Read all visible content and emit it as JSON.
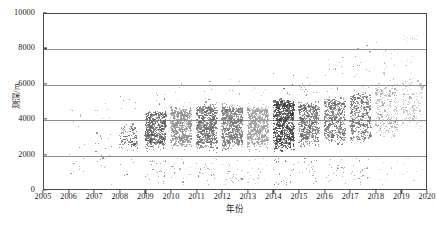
{
  "chart_data": {
    "type": "scatter",
    "title": "",
    "xlabel": "年份",
    "ylabel": "测深/m",
    "xlim": [
      2005,
      2020
    ],
    "ylim": [
      0,
      10000
    ],
    "xticks": [
      2005,
      2006,
      2007,
      2008,
      2009,
      2010,
      2011,
      2012,
      2013,
      2014,
      2015,
      2016,
      2017,
      2018,
      2019,
      2020
    ],
    "yticks": [
      0,
      2000,
      4000,
      6000,
      8000,
      10000
    ],
    "xtick_labels": [
      "2005",
      "2006",
      "2007",
      "2008",
      "2009",
      "2010",
      "2011",
      "2012",
      "2013",
      "2014",
      "2015",
      "2016",
      "2017",
      "2018",
      "2019",
      "2020"
    ],
    "ytick_labels": [
      "0",
      "2000",
      "4000",
      "6000",
      "8000",
      "10000"
    ],
    "grid": "horizontal",
    "gridline_values": [
      2000,
      4000,
      6000,
      8000
    ],
    "legend": "none",
    "marker": "filled-circle",
    "marker_size_px": 1.2,
    "point_color": "#6e6e6e",
    "frame_color": "#4a4a4a",
    "gridline_color": "#8f8f8f",
    "background": "#ffffff",
    "series": [
      {
        "name": "测深",
        "year_bands": [
          {
            "year": 2006,
            "count": 6,
            "core_low": 1100,
            "core_high": 2700,
            "shade": "#7a7a7a",
            "spread": "sparse"
          },
          {
            "year": 2007,
            "count": 16,
            "core_low": 1800,
            "core_high": 3100,
            "shade": "#767676",
            "spread": "sparse"
          },
          {
            "year": 2008,
            "count": 120,
            "core_low": 2550,
            "core_high": 3500,
            "shade": "#5f5f5f",
            "spread": "light"
          },
          {
            "year": 2009,
            "count": 520,
            "core_low": 2700,
            "core_high": 4200,
            "shade": "#5a5a5a",
            "spread": "dense"
          },
          {
            "year": 2010,
            "count": 640,
            "core_low": 2750,
            "core_high": 4350,
            "shade": "#8e8e8e",
            "spread": "dense"
          },
          {
            "year": 2011,
            "count": 700,
            "core_low": 2700,
            "core_high": 4500,
            "shade": "#6b6b6b",
            "spread": "dense"
          },
          {
            "year": 2012,
            "count": 700,
            "core_low": 2700,
            "core_high": 4500,
            "shade": "#757575",
            "spread": "dense"
          },
          {
            "year": 2013,
            "count": 660,
            "core_low": 2750,
            "core_high": 4450,
            "shade": "#9a9a9a",
            "spread": "dense"
          },
          {
            "year": 2014,
            "count": 820,
            "core_low": 2700,
            "core_high": 4800,
            "shade": "#3d3d3d",
            "spread": "dense"
          },
          {
            "year": 2015,
            "count": 560,
            "core_low": 2900,
            "core_high": 4700,
            "shade": "#6a6a6a",
            "spread": "dense"
          },
          {
            "year": 2016,
            "count": 520,
            "core_low": 3000,
            "core_high": 4900,
            "shade": "#707070",
            "spread": "dense"
          },
          {
            "year": 2017,
            "count": 470,
            "core_low": 3100,
            "core_high": 5200,
            "shade": "#6d6d6d",
            "spread": "dense"
          },
          {
            "year": 2018,
            "count": 240,
            "core_low": 3400,
            "core_high": 5500,
            "shade": "#a6a6a6",
            "spread": "medium"
          },
          {
            "year": 2019,
            "count": 150,
            "core_low": 3700,
            "core_high": 5900,
            "shade": "#b4b4b4",
            "spread": "medium"
          },
          {
            "year": 2020,
            "count": 110,
            "core_low": 3900,
            "core_high": 6100,
            "shade": "#ababab",
            "spread": "medium"
          }
        ],
        "max_observed": 8400,
        "min_observed": 400,
        "trend": "increasing"
      }
    ]
  },
  "caption": ""
}
